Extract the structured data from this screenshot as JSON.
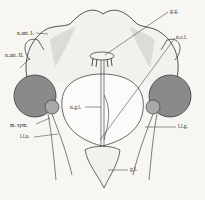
{
  "figure": {
    "type": "anatomical line drawing",
    "labels": {
      "gg": "g.g.",
      "ncl": "n.c.l.",
      "nant1": "n.ant. I.",
      "nant2": "n.ant. II.",
      "ngl": "n.g.l.",
      "msym": "m. sym.",
      "lla": "l.l.a.",
      "llg": "l.l.g.",
      "gl": "g.l."
    },
    "colors": {
      "background": "#f7f6f3",
      "ink": "#2a2a2a",
      "eye_fill": "#8a8a8a",
      "eye_inner": "#a8a8a8"
    }
  }
}
